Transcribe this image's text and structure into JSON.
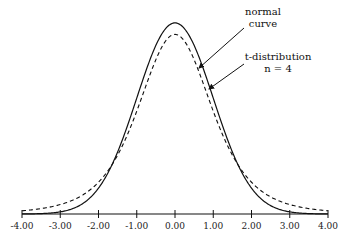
{
  "chart_data": {
    "type": "line",
    "title": "",
    "xlabel": "",
    "ylabel": "",
    "xlim": [
      -4,
      4
    ],
    "grid": false,
    "x_ticks": [
      -4,
      -3,
      -2,
      -1,
      0,
      1,
      2,
      3,
      4
    ],
    "x_tick_labels": [
      "-4.00",
      "-3.00",
      "-2.00",
      "-1.00",
      "0.00",
      "1.00",
      "2.00",
      "3.00",
      "4.00"
    ],
    "series": [
      {
        "name": "normal curve",
        "style": "solid",
        "distribution": "standard normal",
        "x": [
          -4,
          -3,
          -2,
          -1,
          0,
          1,
          2,
          3,
          4
        ],
        "values": [
          0.0001,
          0.0044,
          0.054,
          0.242,
          0.3989,
          0.242,
          0.054,
          0.0044,
          0.0001
        ]
      },
      {
        "name": "t-distribution n = 4",
        "style": "dashed",
        "distribution": "Student t, df=4",
        "x": [
          -4,
          -3,
          -2,
          -1,
          0,
          1,
          2,
          3,
          4
        ],
        "values": [
          0.0066,
          0.0197,
          0.0663,
          0.2147,
          0.375,
          0.2147,
          0.0663,
          0.0197,
          0.0066
        ]
      }
    ],
    "annotations": [
      {
        "line1": "normal",
        "line2": "curve",
        "target": "normal curve"
      },
      {
        "line1": "t-distribution",
        "line2": "n = 4",
        "target": "t-distribution"
      }
    ]
  }
}
